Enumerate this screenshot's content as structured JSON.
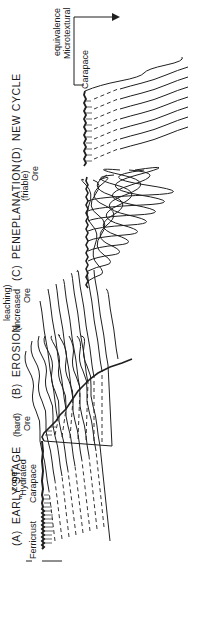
{
  "figure": {
    "orientation": "rotated-90-ccw",
    "panels": [
      {
        "id": "A",
        "title_letter": "(A)",
        "title": "EARLY STAGE",
        "labels": {
          "carapace": "Carapace",
          "hydrated_zone_line1": "\"Hydrated",
          "hydrated_zone_line2": "zone\"",
          "ore_line1": "Ore",
          "ore_line2": "(hard)",
          "ferricrust": "Ferricrust"
        }
      },
      {
        "id": "B",
        "title_letter": "(B)",
        "title": "EROSION",
        "labels": {
          "ore_line1": "Ore",
          "ore_line2": "(increased",
          "ore_line3": "leaching)"
        }
      },
      {
        "id": "C",
        "title_letter": "(C)",
        "title": "PENEPLANATION",
        "labels": {
          "ore_line1": "Ore",
          "ore_line2": "(friable)"
        }
      },
      {
        "id": "D",
        "title_letter": "(D)",
        "title": "NEW CYCLE",
        "labels": {
          "carapace": "Carapace",
          "microtextural_line1": "Microtextural",
          "microtextural_line2": "equivalence"
        }
      }
    ],
    "colors": {
      "ink": "#1f1f1f",
      "background": "#ffffff"
    }
  }
}
